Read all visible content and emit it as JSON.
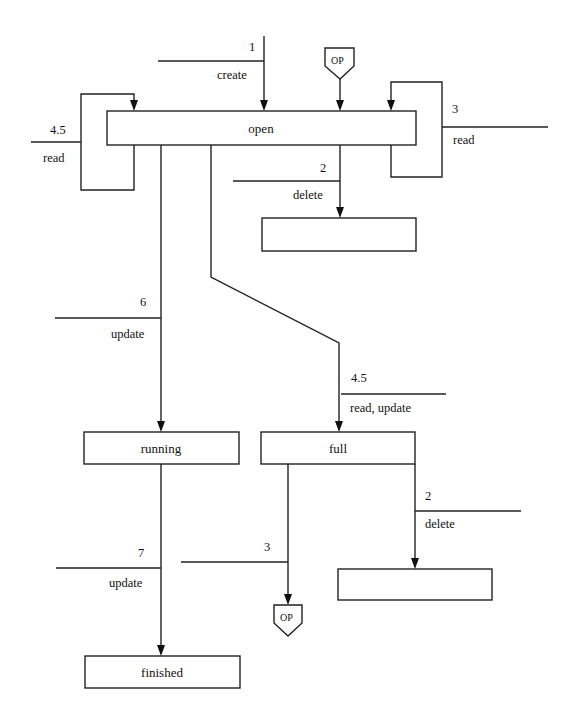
{
  "diagram": {
    "states": {
      "open": "open",
      "delete_target_1": "",
      "running": "running",
      "full": "full",
      "delete_target_2": "",
      "finished": "finished"
    },
    "connectors": {
      "op_top": "OP",
      "op_bottom": "OP"
    },
    "transitions": {
      "create": {
        "number": "1",
        "label": "create"
      },
      "read_loop_left": {
        "number": "4.5",
        "label": "read"
      },
      "read_loop_right": {
        "number": "3",
        "label": "read"
      },
      "delete_from_open": {
        "number": "2",
        "label": "delete"
      },
      "update_to_running": {
        "number": "6",
        "label": "update"
      },
      "read_update_to_full": {
        "number": "4.5",
        "label": "read, update"
      },
      "delete_from_full": {
        "number": "2",
        "label": "delete"
      },
      "to_op_bottom": {
        "number": "3",
        "label": ""
      },
      "update_to_finished": {
        "number": "7",
        "label": "update"
      }
    }
  }
}
